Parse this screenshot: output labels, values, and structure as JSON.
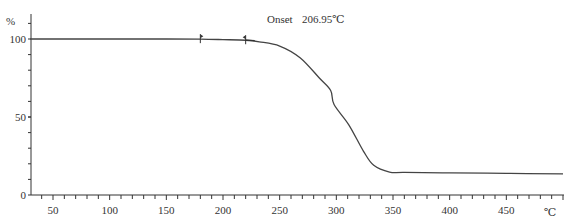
{
  "chart_data": {
    "type": "line",
    "title": "",
    "xlabel": "℃",
    "ylabel": "%",
    "xlim": [
      30,
      500
    ],
    "ylim": [
      0,
      105
    ],
    "x_ticks": [
      50,
      100,
      150,
      200,
      250,
      300,
      350,
      400,
      450
    ],
    "y_ticks": [
      0,
      50,
      100
    ],
    "grid": false,
    "legend": null,
    "annotations": [
      {
        "text": "Onset",
        "value": "206.95℃",
        "x": 206.95
      }
    ],
    "markers": [
      180,
      220
    ],
    "series": [
      {
        "name": "TGA weight",
        "x": [
          30,
          100,
          150,
          180,
          200,
          220,
          232,
          250,
          268,
          285,
          295,
          298,
          311,
          324,
          333,
          347,
          360,
          400,
          450,
          500
        ],
        "values": [
          100,
          100,
          100,
          99.9,
          99.6,
          99.2,
          98.2,
          95.5,
          88,
          75,
          67,
          58,
          45,
          28,
          19,
          14.7,
          14.5,
          14.2,
          13.9,
          13.5
        ]
      }
    ]
  },
  "labels": {
    "y_unit": "%",
    "x_unit": "℃",
    "onset_label": "Onset",
    "onset_value": "206.95℃"
  }
}
